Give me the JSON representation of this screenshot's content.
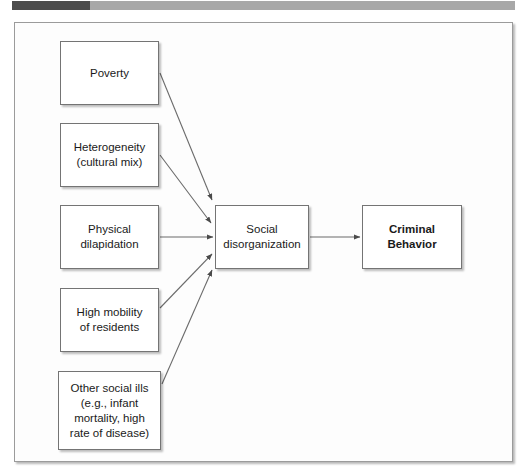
{
  "header": {
    "progress_bar_name": "progress-bar",
    "fill_color": "#4d4d4d",
    "track_color": "#a8a8a8"
  },
  "diagram": {
    "frame_border_color": "#9b9b9b",
    "node_border_color": "#747474",
    "connector_color": "#6b6b6b",
    "nodes": {
      "poverty": {
        "label": "Poverty"
      },
      "heterogeneity": {
        "label": "Heterogeneity\n(cultural mix)"
      },
      "dilapidation": {
        "label": "Physical\ndilapidation"
      },
      "mobility": {
        "label": "High mobility\nof residents"
      },
      "other_ills": {
        "label": "Other social ills\n(e.g., infant\nmortality, high\nrate of disease)"
      },
      "disorganization": {
        "label": "Social\ndisorganization"
      },
      "criminal": {
        "label": "Criminal\nBehavior"
      }
    },
    "edges": [
      {
        "from": "poverty",
        "to": "disorganization"
      },
      {
        "from": "heterogeneity",
        "to": "disorganization"
      },
      {
        "from": "dilapidation",
        "to": "disorganization"
      },
      {
        "from": "mobility",
        "to": "disorganization"
      },
      {
        "from": "other_ills",
        "to": "disorganization"
      },
      {
        "from": "disorganization",
        "to": "criminal"
      }
    ]
  }
}
